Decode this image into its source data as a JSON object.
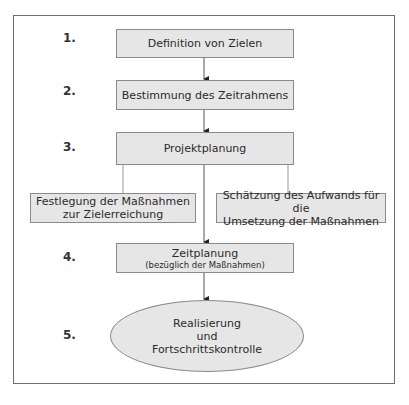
{
  "diagram": {
    "steps": [
      {
        "number": "1.",
        "label": "Definition von Zielen"
      },
      {
        "number": "2.",
        "label": "Bestimmung des Zeitrahmens"
      },
      {
        "number": "3.",
        "label": "Projektplanung"
      },
      {
        "number": "4.",
        "label": "Zeitplanung",
        "sublabel": "(bezüglich der Maßnahmen)"
      },
      {
        "number": "5.",
        "label_lines": [
          "Realisierung",
          "und",
          "Fortschrittskontrolle"
        ]
      }
    ],
    "branches": [
      {
        "label_lines": [
          "Festlegung der Maßnahmen",
          "zur Zielerreichung"
        ]
      },
      {
        "label_lines": [
          "Schätzung des Aufwands für die",
          "Umsetzung der Maßnahmen"
        ]
      }
    ],
    "colors": {
      "box_fill": "#e6e6e6",
      "box_border": "#8a8a8a",
      "frame": "#6e6e6e"
    }
  }
}
